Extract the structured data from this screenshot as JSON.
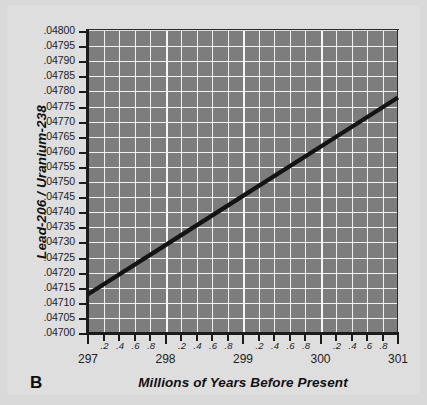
{
  "figure": {
    "panel_letter": "B",
    "background_color": "#dedede",
    "plot_background_color": "#7d7d7d",
    "gridline_color": "#f2f2f2",
    "axis_color": "#1b1b1b",
    "line_color": "#141414"
  },
  "chart_data": {
    "type": "line",
    "title": "",
    "xlabel": "Millions of Years Before Present",
    "ylabel": "Lead-206 / Uranium-238",
    "xlim": [
      297,
      301
    ],
    "ylim": [
      0.047,
      0.048
    ],
    "grid": true,
    "legend": null,
    "x_major_ticks": [
      297,
      298,
      299,
      300,
      301
    ],
    "x_major_tick_labels": [
      "297",
      "298",
      "299",
      "300",
      "301"
    ],
    "x_minor_tick_labels": [
      ".2",
      ".4",
      ".6",
      ".8"
    ],
    "x_minor_tick_step": 0.2,
    "y_ticks": [
      0.047,
      0.04705,
      0.0471,
      0.04715,
      0.0472,
      0.04725,
      0.0473,
      0.04735,
      0.0474,
      0.04745,
      0.0475,
      0.04755,
      0.0476,
      0.04765,
      0.0477,
      0.04775,
      0.0478,
      0.04785,
      0.0479,
      0.04795,
      0.048
    ],
    "y_tick_labels": [
      ".04700",
      ".04705",
      ".04710",
      ".04715",
      ".04720",
      ".04725",
      ".04730",
      ".04735",
      ".04740",
      ".04745",
      ".04750",
      ".04755",
      ".04760",
      ".04765",
      ".04770",
      ".04775",
      ".04780",
      ".04785",
      ".04790",
      ".04795",
      ".04800"
    ],
    "series": [
      {
        "name": "Lead-206 / Uranium-238 ratio",
        "x": [
          297,
          298,
          299,
          300,
          301
        ],
        "values": [
          0.047128,
          0.047291,
          0.047454,
          0.047617,
          0.04778
        ]
      }
    ]
  }
}
